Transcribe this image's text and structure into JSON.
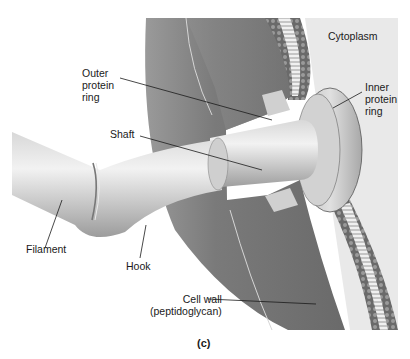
{
  "figure": {
    "caption": "(c)",
    "colors": {
      "background": "#ffffff",
      "cell_wall_dark": "#6e6e6e",
      "cell_wall_mid": "#8a8a8a",
      "cytoplasm": "#e6e6e6",
      "flagellum": "#c9c9c9",
      "membrane": "#5a5a5a",
      "leader_line": "#1a1a1a"
    }
  },
  "labels": {
    "cytoplasm": "Cytoplasm",
    "outer_protein_ring": "Outer\nprotein\nring",
    "inner_protein_ring": "Inner\nprotein\nring",
    "shaft": "Shaft",
    "filament": "Filament",
    "hook": "Hook",
    "cell_wall": "Cell wall\n(peptidoglycan)"
  }
}
